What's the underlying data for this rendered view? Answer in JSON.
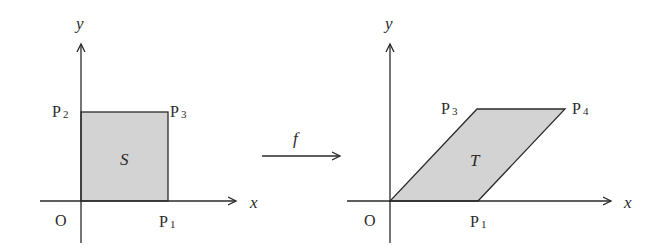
{
  "diagram": {
    "type": "linear-map-illustration",
    "colors": {
      "line": "#2a2a2a",
      "fill": "#d3d3d3",
      "background": "#ffffff"
    },
    "left_panel": {
      "axis_labels": {
        "x": "x",
        "y": "y",
        "origin": "O"
      },
      "region_label": "S",
      "shape": "square",
      "points": [
        {
          "name": "P",
          "sub": "1"
        },
        {
          "name": "P",
          "sub": "2"
        },
        {
          "name": "P",
          "sub": "3"
        }
      ]
    },
    "map": {
      "label": "f"
    },
    "right_panel": {
      "axis_labels": {
        "x": "x",
        "y": "y",
        "origin": "O"
      },
      "region_label": "T",
      "shape": "parallelogram",
      "points": [
        {
          "name": "P",
          "sub": "1"
        },
        {
          "name": "P",
          "sub": "3"
        },
        {
          "name": "P",
          "sub": "4"
        }
      ]
    }
  }
}
